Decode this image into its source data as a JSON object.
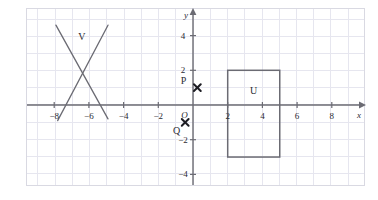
{
  "figure": {
    "kind": "coordinate-grid-diagram",
    "background_color": "#ffffff",
    "frame_color": "#d9d9e2",
    "grid_color": "#e6e6ef",
    "axis_color": "#6b6b73",
    "ink_color": "#6b6b73",
    "text_color": "#2b2b33"
  },
  "axes": {
    "x_axis_label": "x",
    "y_axis_label": "y",
    "origin_label": "O",
    "x_min": -9,
    "x_max": 10,
    "y_min": -5,
    "y_max": 5,
    "x_ticks": [
      {
        "value": -8,
        "label": "−8"
      },
      {
        "value": -6,
        "label": "−6"
      },
      {
        "value": -4,
        "label": "−4"
      },
      {
        "value": -2,
        "label": "−2"
      },
      {
        "value": 2,
        "label": "2"
      },
      {
        "value": 4,
        "label": "4"
      },
      {
        "value": 6,
        "label": "6"
      },
      {
        "value": 8,
        "label": "8"
      }
    ],
    "y_ticks": [
      {
        "value": 4,
        "label": "4"
      },
      {
        "value": 2,
        "label": "2"
      },
      {
        "value": -2,
        "label": "−2"
      },
      {
        "value": -4,
        "label": "−4"
      }
    ],
    "grid_step": 1,
    "grid_visible": true
  },
  "chart_data": {
    "type": "scatter",
    "title": "",
    "xlabel": "x",
    "ylabel": "y",
    "xlim": [
      -9,
      10
    ],
    "ylim": [
      -5,
      5
    ],
    "grid": true,
    "shapes": [
      {
        "name": "U",
        "label": "U",
        "type": "rectangle",
        "x_left": 2,
        "x_right": 5,
        "y_bottom": -3,
        "y_top": 2,
        "width_units": 3,
        "height_units": 5,
        "label_position": {
          "x": 3.5,
          "y": 0.85
        },
        "filled": false
      },
      {
        "name": "V",
        "label": "V",
        "type": "cross-lines",
        "segments": [
          {
            "from": {
              "x": -7.9,
              "y": 4.6
            },
            "to": {
              "x": -4.9,
              "y": -0.8
            }
          },
          {
            "from": {
              "x": -7.8,
              "y": -0.9
            },
            "to": {
              "x": -4.9,
              "y": 4.6
            }
          }
        ],
        "label_position": {
          "x": -6.4,
          "y": 4.0
        }
      }
    ],
    "points": [
      {
        "name": "P",
        "label": "P",
        "marker": "cross",
        "x": 0.25,
        "y": 1.0,
        "label_position": {
          "x": -0.55,
          "y": 1.45
        }
      },
      {
        "name": "Q",
        "label": "Q",
        "marker": "cross",
        "x": -0.45,
        "y": -1.0,
        "label_position": {
          "x": -0.95,
          "y": -1.45
        }
      }
    ]
  }
}
